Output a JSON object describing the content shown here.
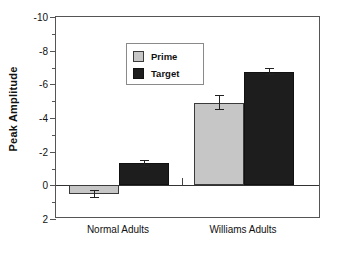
{
  "chart_data": {
    "type": "bar",
    "title": "",
    "xlabel": "",
    "ylabel": "Peak Amplitude",
    "categories": [
      "Normal Adults",
      "Williams Adults"
    ],
    "ylim": [
      2,
      -10
    ],
    "yticks": [
      -10,
      -8,
      -6,
      -4,
      -2,
      0,
      2
    ],
    "ytick_labels": [
      "-10",
      "-8",
      "-6",
      "-4",
      "-2",
      "0",
      "2"
    ],
    "y_axis_inverted": true,
    "grid": false,
    "legend_position": "upper-left-inside",
    "series": [
      {
        "name": "Prime",
        "color": "#c6c6c6",
        "values": [
          0.5,
          -4.9
        ],
        "errors": [
          0.25,
          0.45
        ]
      },
      {
        "name": "Target",
        "color": "#1d1d1d",
        "values": [
          -1.3,
          -6.75
        ],
        "errors": [
          0.2,
          0.2
        ]
      }
    ]
  },
  "legend": {
    "entries": [
      {
        "label": "Prime",
        "swatch": "prime-swatch"
      },
      {
        "label": "Target",
        "swatch": "target-swatch"
      }
    ]
  },
  "axes": {
    "y_title": "Peak Amplitude",
    "y_tick_labels": [
      "-10",
      "-8",
      "-6",
      "-4",
      "-2",
      "0",
      "2"
    ],
    "x_tick_labels": [
      "Normal Adults",
      "Williams Adults"
    ]
  }
}
